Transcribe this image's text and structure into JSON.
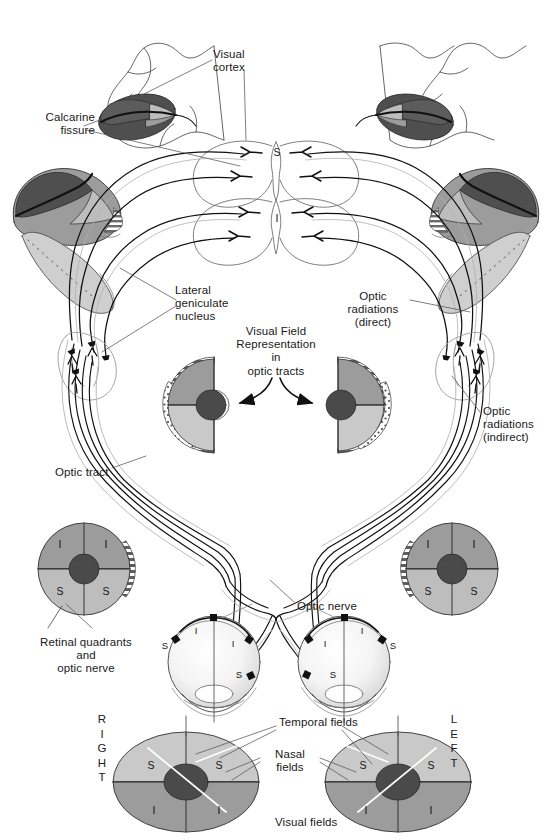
{
  "figure": {
    "type": "anatomical-diagram"
  },
  "palette": {
    "ink": "#1a1a1a",
    "line_dark": "#111111",
    "line_mid": "#6f6f6f",
    "line_light": "#a8a8a8",
    "gray_darkest": "#4a4a4a",
    "gray_dark": "#5e5e5e",
    "gray_mid": "#9a9a9a",
    "gray_light": "#c4c4c4",
    "gray_lighter": "#d8d8d8",
    "white": "#ffffff"
  },
  "labels": {
    "visual_cortex": "Visual\ncortex",
    "calcarine_fissure": "Calcarine\nfissure",
    "lateral_geniculate_nucleus": "Lateral\ngeniculate\nnucleus",
    "optic_radiations_direct": "Optic\nradiations\n(direct)",
    "optic_radiations_indirect": "Optic\nradiations\n(indirect)",
    "visual_field_representation": "Visual Field\nRepresentation\nin\noptic tracts",
    "optic_tract": "Optic tract",
    "optic_nerve": "Optic nerve",
    "retinal_quadrants": "Retinal quadrants\nand\noptic nerve",
    "temporal_fields": "Temporal fields",
    "nasal_fields": "Nasal\nfields",
    "visual_fields": "Visual fields",
    "right": "R\nI\nG\nH\nT",
    "left": "L\nE\nF\nT"
  },
  "quadrant_markers": {
    "superior": "S",
    "inferior": "I"
  },
  "cortex_markers": {
    "superior": "S",
    "inferior": "I"
  },
  "label_positions": {
    "visual_cortex": {
      "x": 213,
      "y": 48
    },
    "calcarine_fissure": {
      "x": 28,
      "y": 111
    },
    "lateral_geniculate_nucleus": {
      "x": 175,
      "y": 284
    },
    "optic_radiations_direct": {
      "x": 355,
      "y": 290
    },
    "optic_radiations_indirect": {
      "x": 483,
      "y": 405
    },
    "visual_field_representation": {
      "x": 276,
      "y": 325
    },
    "optic_tract": {
      "x": 55,
      "y": 466
    },
    "optic_nerve": {
      "x": 297,
      "y": 600
    },
    "retinal_quadrants": {
      "x": 85,
      "y": 636
    },
    "temporal_fields": {
      "x": 279,
      "y": 722
    },
    "nasal_fields": {
      "x": 280,
      "y": 754
    },
    "visual_fields": {
      "x": 275,
      "y": 818
    },
    "right": {
      "x": 100,
      "y": 716
    },
    "left": {
      "x": 452,
      "y": 716
    }
  },
  "discs": {
    "visual_field_rep_left": {
      "cx": 210,
      "cy": 405,
      "label": "left-optic-tract-half-field"
    },
    "visual_field_rep_right": {
      "cx": 340,
      "cy": 405,
      "label": "right-optic-tract-half-field"
    },
    "retina_left": {
      "cx": 84,
      "cy": 569,
      "r": 46,
      "markers": [
        "I",
        "I",
        "S",
        "S"
      ]
    },
    "retina_right": {
      "cx": 452,
      "cy": 569,
      "r": 46,
      "markers": [
        "I",
        "I",
        "S",
        "S"
      ]
    },
    "visual_field_left": {
      "cx": 186,
      "cy": 782,
      "rx": 73,
      "ry": 50,
      "markers": [
        "S",
        "S",
        "I",
        "I"
      ]
    },
    "visual_field_right": {
      "cx": 398,
      "cy": 782,
      "rx": 73,
      "ry": 50,
      "markers": [
        "S",
        "S",
        "I",
        "I"
      ]
    }
  },
  "eyes": {
    "left_eye": {
      "cx": 214,
      "cy": 662,
      "r": 46
    },
    "right_eye": {
      "cx": 344,
      "cy": 662,
      "r": 46
    }
  }
}
